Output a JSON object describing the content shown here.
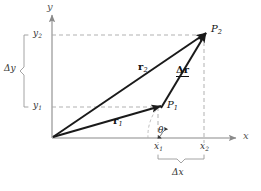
{
  "figure": {
    "type": "vector-displacement-diagram",
    "background": "#ffffff",
    "colors": {
      "vector_stroke": "#1a1a1a",
      "axis_stroke": "#8a8a8a",
      "dashed_stroke": "#a8a8a8",
      "brace_stroke": "#9a9a9a",
      "text": "#1a1a1a"
    }
  },
  "axes": {
    "y_label": "y",
    "x_label": "x",
    "origin_label": "",
    "y_ticks": [
      {
        "label": "y",
        "sub": "1"
      },
      {
        "label": "y",
        "sub": "2"
      }
    ],
    "x_ticks": [
      {
        "label": "x",
        "sub": "1"
      },
      {
        "label": "x",
        "sub": "2"
      }
    ]
  },
  "points": [
    {
      "name": "P",
      "sub": "1",
      "label": "P1"
    },
    {
      "name": "P",
      "sub": "2",
      "label": "P2"
    }
  ],
  "vectors": [
    {
      "name": "r",
      "sub": "1",
      "label": "r1",
      "from": "origin",
      "to": "P1"
    },
    {
      "name": "r",
      "sub": "2",
      "label": "r2",
      "from": "origin",
      "to": "P2"
    },
    {
      "name": "Δr",
      "sub": "",
      "label": "delta-r",
      "from": "P1",
      "to": "P2"
    }
  ],
  "braces": [
    {
      "name": "delta-y",
      "label": "Δy",
      "orientation": "vertical"
    },
    {
      "name": "delta-x",
      "label": "Δx",
      "orientation": "horizontal"
    }
  ],
  "angle": {
    "label": "θ",
    "name": "theta"
  }
}
